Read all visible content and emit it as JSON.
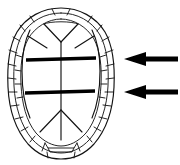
{
  "figure": {
    "title": "Turtle carapace dorsal view with two indicated transverse seams",
    "background_color": "#ffffff",
    "line_color": "#121212",
    "highlight_color": "#000000",
    "arrow_color": "#000000",
    "width": 180,
    "height": 165
  },
  "diagram": {
    "subject": "turtle-carapace",
    "view": "dorsal",
    "element_labels": {
      "outline": "carapace-outline",
      "outline_inner": "carapace-inner-rim",
      "marginal_scutes": "marginal-scutes",
      "vertebral_scutes": "vertebral-scutes",
      "pleural_scutes": "pleural-scutes",
      "nuchal_scute": "nuchal-scute",
      "midline": "vertebral-midline",
      "seam_upper": "highlighted-seam-upper",
      "seam_lower": "highlighted-seam-lower",
      "arrow_upper": "pointer-arrow-upper",
      "arrow_lower": "pointer-arrow-lower"
    }
  },
  "annotations": {
    "arrows": [
      {
        "name": "pointer-arrow-upper",
        "direction": "left",
        "tip_x": 124,
        "tip_y": 59,
        "tail_x": 178,
        "tail_y": 59,
        "points_to": "highlighted-seam-upper",
        "color": "#000000"
      },
      {
        "name": "pointer-arrow-lower",
        "direction": "left",
        "tip_x": 124,
        "tip_y": 92,
        "tail_x": 178,
        "tail_y": 92,
        "points_to": "highlighted-seam-lower",
        "color": "#000000"
      }
    ],
    "highlighted_seams": [
      {
        "name": "highlighted-seam-upper",
        "y": 59,
        "x_start": 26,
        "x_end": 96,
        "stroke_width": 3.4
      },
      {
        "name": "highlighted-seam-lower",
        "y": 92,
        "x_start": 25,
        "x_end": 95,
        "stroke_width": 3.4
      }
    ]
  },
  "geometry": {
    "outline_outer": "M61,8 C79,8 95,17 104,32 C112,46 114,66 113,86 C112,108 106,129 94,143 C84,154 72,158 61,158 C50,158 38,154 28,143 C16,129 10,108 9,86 C8,66 10,46 18,32 C27,17 43,8 61,8 Z",
    "outline_inner": "M61,14 C77,14 91,22 99,35 C106,48 108,66 107,85 C106,105 101,125 90,138 C81,148 71,152 61,152 C51,152 41,148 32,138 C21,125 16,105 15,85 C14,66 16,48 23,35 C31,22 45,14 61,14 Z",
    "outline_inner2": "M61,20 C75,20 87,27 94,39 C100,50 102,66 101,84 C100,102 96,120 86,132 C78,141 69,145 61,145 C53,145 44,141 36,132 C26,120 22,102 21,84 C20,66 22,50 28,39 C35,27 47,20 61,20 Z",
    "midline_x": 61,
    "midline_top_y": 40,
    "midline_bottom_y": 140
  }
}
